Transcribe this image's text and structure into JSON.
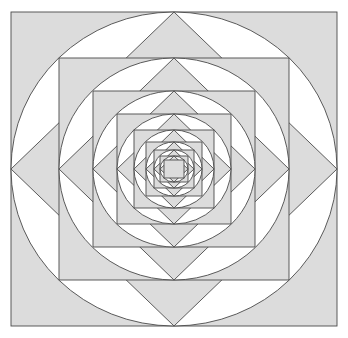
{
  "canvas": {
    "width": 348,
    "height": 338,
    "background": "#ffffff"
  },
  "figure": {
    "center": {
      "x": 174,
      "y": 169
    },
    "levels": 5,
    "stroke_color": "#4a4a4a",
    "stroke_width": 0.9,
    "fill_shaded": "#dcdcdc",
    "fill_plain": "#ffffff",
    "outer_square": {
      "x": 11,
      "y": 12,
      "width": 326,
      "height": 314
    }
  },
  "chart_data": {
    "type": "diagram",
    "shapes": [
      {
        "index": 0,
        "kind": "square",
        "cx": 174,
        "cy": 169,
        "half_w": 163,
        "half_h": 157,
        "rotation": 0,
        "fill": "#dcdcdc",
        "stroke": "#4a4a4a"
      },
      {
        "index": 0,
        "kind": "circle",
        "cx": 174,
        "cy": 169,
        "rx": 163,
        "ry": 157,
        "rotation": 0,
        "fill": "#ffffff",
        "stroke": "#4a4a4a"
      },
      {
        "index": 0,
        "kind": "diamond",
        "cx": 174,
        "cy": 169,
        "half_w": 163,
        "half_h": 157,
        "rotation": 45,
        "fill": "#dcdcdc",
        "stroke": "#4a4a4a"
      },
      {
        "index": 1,
        "kind": "square",
        "cx": 174,
        "cy": 169,
        "half_w": 115,
        "half_h": 111,
        "rotation": 0,
        "fill": "#dcdcdc",
        "stroke": "#4a4a4a"
      },
      {
        "index": 1,
        "kind": "circle",
        "cx": 174,
        "cy": 169,
        "rx": 115,
        "ry": 111,
        "rotation": 0,
        "fill": "#ffffff",
        "stroke": "#4a4a4a"
      },
      {
        "index": 1,
        "kind": "diamond",
        "cx": 174,
        "cy": 169,
        "half_w": 115,
        "half_h": 111,
        "rotation": 45,
        "fill": "#dcdcdc",
        "stroke": "#4a4a4a"
      },
      {
        "index": 2,
        "kind": "square",
        "cx": 174,
        "cy": 169,
        "half_w": 81,
        "half_h": 78,
        "rotation": 0,
        "fill": "#dcdcdc",
        "stroke": "#4a4a4a"
      },
      {
        "index": 2,
        "kind": "circle",
        "cx": 174,
        "cy": 169,
        "rx": 81,
        "ry": 78,
        "rotation": 0,
        "fill": "#ffffff",
        "stroke": "#4a4a4a"
      },
      {
        "index": 2,
        "kind": "diamond",
        "cx": 174,
        "cy": 169,
        "half_w": 81,
        "half_h": 78,
        "rotation": 45,
        "fill": "#dcdcdc",
        "stroke": "#4a4a4a"
      },
      {
        "index": 3,
        "kind": "square",
        "cx": 174,
        "cy": 169,
        "half_w": 57,
        "half_h": 55,
        "rotation": 0,
        "fill": "#dcdcdc",
        "stroke": "#4a4a4a"
      },
      {
        "index": 3,
        "kind": "circle",
        "cx": 174,
        "cy": 169,
        "rx": 57,
        "ry": 55,
        "rotation": 0,
        "fill": "#ffffff",
        "stroke": "#4a4a4a"
      },
      {
        "index": 3,
        "kind": "diamond",
        "cx": 174,
        "cy": 169,
        "half_w": 57,
        "half_h": 55,
        "rotation": 45,
        "fill": "#dcdcdc",
        "stroke": "#4a4a4a"
      },
      {
        "index": 4,
        "kind": "square",
        "cx": 174,
        "cy": 169,
        "half_w": 40,
        "half_h": 39,
        "rotation": 0,
        "fill": "#dcdcdc",
        "stroke": "#4a4a4a"
      },
      {
        "index": 4,
        "kind": "circle",
        "cx": 174,
        "cy": 169,
        "rx": 40,
        "ry": 39,
        "rotation": 0,
        "fill": "#ffffff",
        "stroke": "#4a4a4a"
      },
      {
        "index": 4,
        "kind": "diamond",
        "cx": 174,
        "cy": 169,
        "half_w": 40,
        "half_h": 39,
        "rotation": 45,
        "fill": "#dcdcdc",
        "stroke": "#4a4a4a"
      },
      {
        "index": 5,
        "kind": "square",
        "cx": 174,
        "cy": 169,
        "half_w": 28,
        "half_h": 27,
        "rotation": 0,
        "fill": "#dcdcdc",
        "stroke": "#4a4a4a"
      },
      {
        "index": 5,
        "kind": "circle",
        "cx": 174,
        "cy": 169,
        "rx": 28,
        "ry": 27,
        "rotation": 0,
        "fill": "#ffffff",
        "stroke": "#4a4a4a"
      },
      {
        "index": 5,
        "kind": "diamond",
        "cx": 174,
        "cy": 169,
        "half_w": 28,
        "half_h": 27,
        "rotation": 45,
        "fill": "#dcdcdc",
        "stroke": "#4a4a4a"
      },
      {
        "index": 6,
        "kind": "square",
        "cx": 174,
        "cy": 169,
        "half_w": 20,
        "half_h": 19,
        "rotation": 0,
        "fill": "#dcdcdc",
        "stroke": "#4a4a4a"
      },
      {
        "index": 6,
        "kind": "circle",
        "cx": 174,
        "cy": 169,
        "rx": 20,
        "ry": 19,
        "rotation": 0,
        "fill": "#ffffff",
        "stroke": "#4a4a4a"
      },
      {
        "index": 6,
        "kind": "diamond",
        "cx": 174,
        "cy": 169,
        "half_w": 20,
        "half_h": 19,
        "rotation": 45,
        "fill": "#dcdcdc",
        "stroke": "#4a4a4a"
      },
      {
        "index": 7,
        "kind": "square",
        "cx": 174,
        "cy": 169,
        "half_w": 14,
        "half_h": 13,
        "rotation": 0,
        "fill": "#dcdcdc",
        "stroke": "#4a4a4a"
      },
      {
        "index": 7,
        "kind": "circle",
        "cx": 174,
        "cy": 169,
        "rx": 14,
        "ry": 13,
        "rotation": 0,
        "fill": "#ffffff",
        "stroke": "#4a4a4a"
      },
      {
        "index": 7,
        "kind": "diamond",
        "cx": 174,
        "cy": 169,
        "half_w": 14,
        "half_h": 13,
        "rotation": 45,
        "fill": "#dcdcdc",
        "stroke": "#4a4a4a"
      },
      {
        "index": 8,
        "kind": "square",
        "cx": 174,
        "cy": 169,
        "half_w": 10,
        "half_h": 9,
        "rotation": 0,
        "fill": "#dcdcdc",
        "stroke": "#4a4a4a"
      }
    ]
  }
}
